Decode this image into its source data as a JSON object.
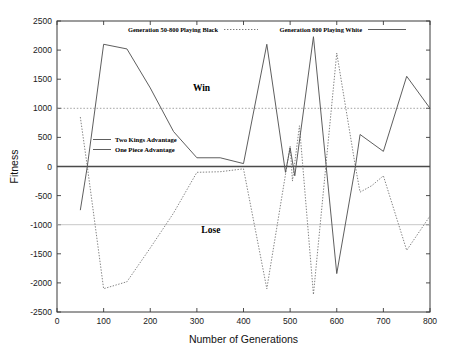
{
  "chart_data": {
    "type": "line",
    "title": "",
    "xlabel": "Number of Generations",
    "ylabel": "Fitness",
    "xlim": [
      0,
      800
    ],
    "ylim": [
      -2500,
      2500
    ],
    "xticks": [
      0,
      100,
      200,
      300,
      400,
      500,
      600,
      700,
      800
    ],
    "yticks": [
      -2500,
      -2000,
      -1500,
      -1000,
      -500,
      0,
      500,
      1000,
      1500,
      2000,
      2500
    ],
    "xtick_labels": [
      "0",
      "100",
      "200",
      "300",
      "400",
      "500",
      "600",
      "700",
      "800"
    ],
    "ytick_labels": [
      "-2500",
      "-2000",
      "-1500",
      "-1000",
      "-500",
      "0",
      "500",
      "1000",
      "1500",
      "2000",
      "2500"
    ],
    "grid": false,
    "legend_position": "top-outside",
    "reference_lines": [
      {
        "name": "Two Kings Advantage",
        "y": 1000,
        "style": "dotted"
      },
      {
        "name": "One Piece Advantage",
        "y": -1000,
        "style": "solid-light"
      },
      {
        "name": "zero-axis",
        "y": 0,
        "style": "solid"
      }
    ],
    "annotations": [
      {
        "text": "Win",
        "x": 310,
        "y": 1300
      },
      {
        "text": "Lose",
        "x": 330,
        "y": -1150
      }
    ],
    "series": [
      {
        "name": "Generation 50-800 Playing Black",
        "style": "dotted",
        "color": "#6b6b6b",
        "x": [
          50,
          65,
          100,
          150,
          200,
          250,
          300,
          350,
          400,
          450,
          500,
          505,
          520,
          550,
          600,
          640,
          650,
          675,
          700,
          750,
          800
        ],
        "values": [
          850,
          0,
          -2100,
          -1980,
          -1400,
          -800,
          -100,
          -90,
          -40,
          -2100,
          350,
          -250,
          700,
          -2200,
          1950,
          0,
          -440,
          -330,
          -160,
          -1440,
          -850
        ]
      },
      {
        "name": "Generation 800 Playing White",
        "style": "solid",
        "color": "#555555",
        "x": [
          50,
          65,
          100,
          150,
          200,
          250,
          300,
          350,
          400,
          450,
          490,
          500,
          510,
          550,
          600,
          640,
          650,
          700,
          750,
          800
        ],
        "values": [
          -750,
          0,
          2100,
          2020,
          1350,
          600,
          150,
          150,
          50,
          2100,
          -100,
          320,
          -160,
          2230,
          -1840,
          0,
          550,
          260,
          1550,
          1000
        ]
      }
    ]
  },
  "legend": {
    "top": [
      {
        "label": "Generation 50-800 Playing Black",
        "style": "dotted"
      },
      {
        "label": "Generation 800 Playing White",
        "style": "solid"
      }
    ],
    "inner": [
      {
        "label": "Two Kings Advantage",
        "style": "solid"
      },
      {
        "label": "One Piece Advantage",
        "style": "solid"
      }
    ]
  },
  "colors": {
    "line_black_series": "#6b6b6b",
    "line_white_series": "#555555",
    "axis": "#3a3a3a",
    "text": "#111111",
    "ref_win": "#8a8a8a",
    "ref_lose": "#b9b9b9",
    "zero": "#4a4a4a"
  }
}
